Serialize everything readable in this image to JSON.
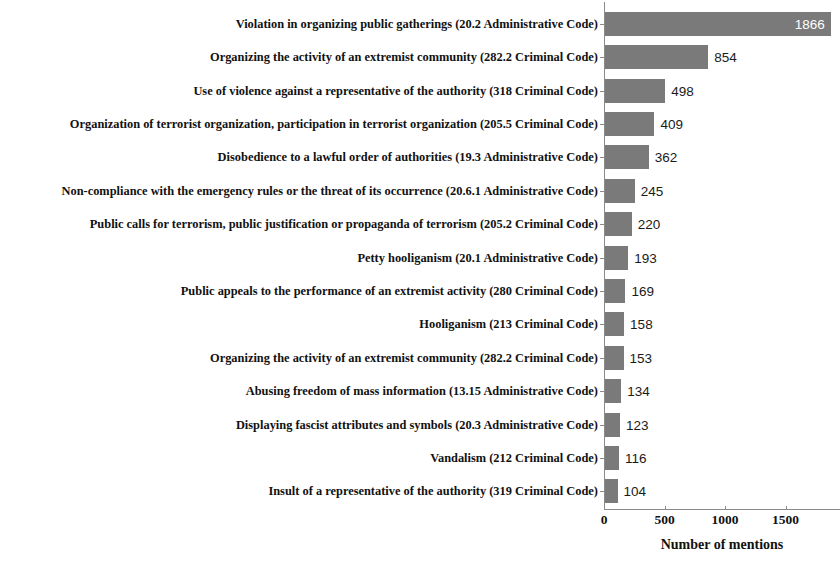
{
  "chart_data": {
    "type": "bar",
    "orientation": "horizontal",
    "title": "",
    "xlabel": "Number of mentions",
    "ylabel": "",
    "xlim": [
      0,
      1950
    ],
    "xticks": [
      0,
      500,
      1000,
      1500
    ],
    "xtick_labels": [
      "0",
      "500",
      "1000",
      "1500"
    ],
    "grid": false,
    "legend": null,
    "bar_color": "#7a7a7a",
    "categories": [
      "Violation in organizing public gatherings (20.2 Administrative Code)",
      "Organizing the activity of an extremist community (282.2 Criminal Code)",
      "Use of violence against a representative of the authority (318 Criminal Code)",
      "Organization of terrorist organization, participation in terrorist organization (205.5 Criminal Code)",
      "Disobedience to a lawful order of authorities (19.3 Administrative Code)",
      "Non-compliance with the emergency rules or the threat of its occurrence (20.6.1 Administrative Code)",
      "Public calls for terrorism, public justification or propaganda of terrorism (205.2 Criminal Code)",
      "Petty hooliganism (20.1 Administrative Code)",
      "Public appeals to the performance of an extremist activity (280 Criminal Code)",
      "Hooliganism (213 Criminal Code)",
      "Organizing the activity of an extremist community (282.2 Criminal Code)",
      "Abusing freedom of mass information (13.15 Administrative Code)",
      "Displaying fascist attributes and symbols (20.3 Administrative Code)",
      "Vandalism (212 Criminal Code)",
      "Insult of a representative of the authority (319 Criminal Code)"
    ],
    "values": [
      1866,
      854,
      498,
      409,
      362,
      245,
      220,
      193,
      169,
      158,
      153,
      134,
      123,
      116,
      104
    ],
    "value_labels": [
      "1866",
      "854",
      "498",
      "409",
      "362",
      "245",
      "220",
      "193",
      "169",
      "158",
      "153",
      "134",
      "123",
      "116",
      "104"
    ]
  }
}
